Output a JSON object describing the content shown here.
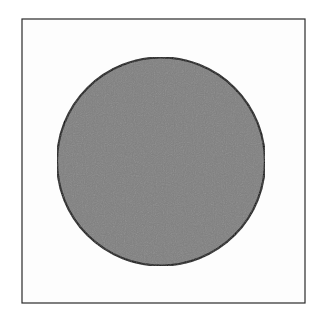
{
  "figure": {
    "background_color": "#ffffff",
    "frame": {
      "shape": "square",
      "x": 22,
      "y": 19,
      "width": 283,
      "height": 284,
      "stroke_color": "#2a2a2a",
      "stroke_width": 1.2,
      "fill_color": "#fdfdfd"
    },
    "circle": {
      "shape": "circle",
      "cx": 161,
      "cy": 161.5,
      "r": 104,
      "fill_color": "#808080",
      "stroke_color": "#111111",
      "stroke_width": 2.2
    }
  }
}
